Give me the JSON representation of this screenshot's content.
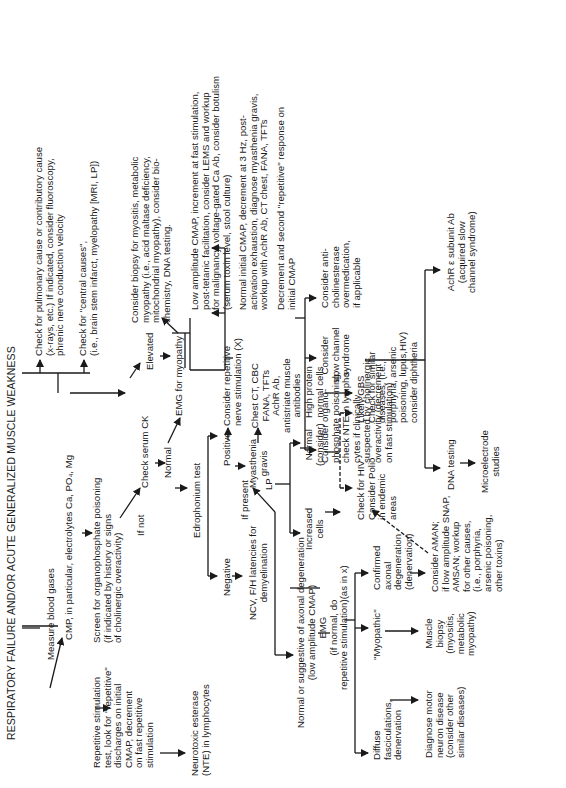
{
  "title": "RESPIRATORY FAILURE AND/OR ACUTE GENERALIZED MUSCLE WEAKNESS",
  "nodes": {
    "measure_blood_gases": "Measure blood gases",
    "cmp": [
      "CMP, in particular, electrolytes Ca, PO₄, Mg"
    ],
    "pulmonary": [
      "Check for pulmonary cause or contributory cause",
      "(x-rays, etc.) If indicated, consider fluoroscopy,",
      "phrenic nerve conduction velocity"
    ],
    "central": [
      "Check for \"central causes\",",
      "(i.e., brain stem infarct, myelopathy [MRI, LP])"
    ],
    "screen_op": [
      "Screen for organophosphate poisoning",
      "(if indicated by history or signs",
      "of cholinergic overactivity)"
    ],
    "repetitive_test": [
      "Repetitive stimulation",
      "test, look for \"repetitive\"",
      "discharges on initial",
      "CMAP, decrement",
      "on fast repetitive",
      "stimulation"
    ],
    "nte": [
      "Neurotoxic esterase",
      "(NTE) in lymphocytes"
    ],
    "if_not": "If not",
    "check_ck": "Check serum CK",
    "elevated": "Elevated",
    "normal_ck": "Normal",
    "emg_myopathy": "EMG for myopathy",
    "biopsy_myositis": [
      "Consider biopsy for myositis, metabolic",
      "myopathy (i.e., acid maltase deficiency,",
      "mitochondrial myopathy), consider bio-",
      "chemistry, DNA testing."
    ],
    "edrophonium": "Edrophonium  test",
    "positive": "Positive",
    "negative": "Negative",
    "repetitive_nerve": [
      "Consider repetitive",
      "nerve stimulation (X)"
    ],
    "myasthenia": [
      "Myasthenia",
      "gravis"
    ],
    "chest_ct": [
      "Chest CT, CBC",
      "FANA, TFTs",
      "AchR Ab,",
      "antistriate muscle",
      "antibodies"
    ],
    "low_amp": [
      "Low amplitude CMAP, increment at fast stimulation,",
      "post-tetanic facilitation, consider LEMS and workup",
      "for malignancy, voltage-gated Ca Ab, consider botulism",
      "(serum toxin level, stool culture)"
    ],
    "normal_initial": [
      "Normal initial CMAP, decrement at 3 Hz, post-",
      "activation exhaustion, diagnose myasthenia gravis,",
      "workup with AchR Ab, CT chest, FANA, TFTs"
    ],
    "decrement_second": [
      "Decrement and second \"repetitive\" response on",
      "initial CMAP"
    ],
    "organo": [
      "Consider organo-",
      "phosphate poisoning,",
      "check NTE in lympho-",
      "cytes if clinically",
      "suspected by cholinergic",
      "overactivity (decrement",
      "on fast stimulation)"
    ],
    "slow_channel": [
      "Consider",
      "slow channel",
      "syndrome"
    ],
    "anticholinesterase": [
      "Consider anti-",
      "cholinesterase",
      "overmedication,",
      "if applicable"
    ],
    "dna_testing": "DNA testing",
    "microelectrode": [
      "Microelectrode",
      "studies"
    ],
    "achr_subunit": [
      "AchR ε subunit Ab",
      "(acquired slow",
      "channel syndrome)"
    ],
    "ncv": [
      "NCV, F/H  latencies for",
      "demyelination"
    ],
    "if_present": "If present",
    "lp": "LP",
    "increased_cells": [
      "Increased",
      "cells"
    ],
    "normal_consider": [
      "Normal",
      "(consider)"
    ],
    "high_protein": [
      "High protein",
      "normal cells"
    ],
    "likely_gbs": [
      "Likely GBS",
      "Check for similar",
      "diseases, (i.e.,",
      "porphyria, arsenic",
      "poisoning, lupus,HIV)",
      "consider diphtheria"
    ],
    "check_hiv": [
      "Check for HIV",
      "Consider Polio",
      "in endemic",
      "areas"
    ],
    "normal_or_axonal": [
      "Normal or  suggestive of axonal degeneration",
      "(low amplitude CMAP)"
    ],
    "emg": [
      "EMG",
      "(if normal, do",
      "repetitive stimulation)(as in x)"
    ],
    "diffuse": [
      "Diffuse",
      "fasciculations,",
      "denervation"
    ],
    "myopathic": "\"Myopathic\"",
    "confirmed_axonal": [
      "Confirmed",
      "axonal",
      "degeneration",
      "(denervation)"
    ],
    "motor_neuron": [
      "Diagnose motor",
      "neuron disease",
      "(consider other",
      "similar diseases)"
    ],
    "muscle_biopsy": [
      "Muscle",
      "biopsy",
      "(myositis,",
      "metabolic",
      "myopathy)"
    ],
    "aman": [
      "Consider AMAN;",
      "if low amplitude SNAP,",
      "AMSAN; workup",
      "for other causes,",
      "(i.e., porphyria,",
      "arsenic poisoning,",
      "other toxins)"
    ]
  }
}
